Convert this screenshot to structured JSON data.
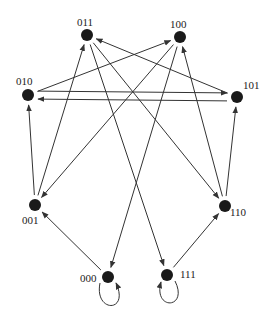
{
  "diagram": {
    "type": "state-transition-graph",
    "colors": {
      "node": "#1a1a1a",
      "edge": "#333333",
      "label": "#222222",
      "background": "#ffffff"
    },
    "nodes": [
      {
        "id": "011",
        "label": "011",
        "x": 87,
        "y": 35,
        "lx": 77,
        "ly": 16
      },
      {
        "id": "100",
        "label": "100",
        "x": 180,
        "y": 37,
        "lx": 170,
        "ly": 18
      },
      {
        "id": "010",
        "label": "010",
        "x": 28,
        "y": 95,
        "lx": 16,
        "ly": 75
      },
      {
        "id": "101",
        "label": "101",
        "x": 237,
        "y": 97,
        "lx": 243,
        "ly": 79
      },
      {
        "id": "001",
        "label": "001",
        "x": 35,
        "y": 205,
        "lx": 22,
        "ly": 214
      },
      {
        "id": "110",
        "label": "110",
        "x": 225,
        "y": 206,
        "lx": 230,
        "ly": 206
      },
      {
        "id": "000",
        "label": "000",
        "x": 108,
        "y": 277,
        "lx": 80,
        "ly": 272
      },
      {
        "id": "111",
        "label": "111",
        "x": 167,
        "y": 275,
        "lx": 180,
        "ly": 268
      }
    ],
    "edges": [
      {
        "from": "000",
        "to": "000"
      },
      {
        "from": "000",
        "to": "001"
      },
      {
        "from": "001",
        "to": "010"
      },
      {
        "from": "001",
        "to": "011"
      },
      {
        "from": "010",
        "to": "100"
      },
      {
        "from": "010",
        "to": "101"
      },
      {
        "from": "011",
        "to": "110"
      },
      {
        "from": "011",
        "to": "111"
      },
      {
        "from": "100",
        "to": "000"
      },
      {
        "from": "100",
        "to": "001"
      },
      {
        "from": "101",
        "to": "010"
      },
      {
        "from": "101",
        "to": "011"
      },
      {
        "from": "110",
        "to": "100"
      },
      {
        "from": "110",
        "to": "101"
      },
      {
        "from": "111",
        "to": "110"
      },
      {
        "from": "111",
        "to": "111"
      }
    ]
  }
}
